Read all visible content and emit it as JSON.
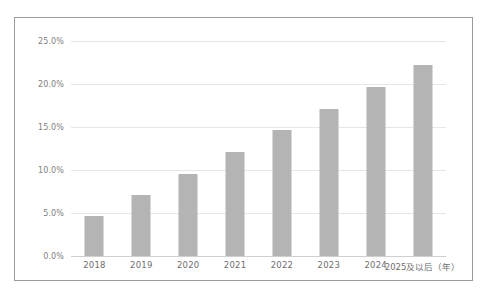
{
  "chart_data": {
    "type": "bar",
    "title": "",
    "subtitle": "",
    "xlabel": "年",
    "ylabel": "",
    "categories": [
      "2018",
      "2019",
      "2020",
      "2021",
      "2022",
      "2023",
      "2024",
      "2025及以后（年）"
    ],
    "values": [
      4.6,
      7.1,
      9.5,
      12.1,
      14.6,
      17.1,
      19.6,
      22.2
    ],
    "series": [
      {
        "name": "占比",
        "values": [
          4.6,
          7.1,
          9.5,
          12.1,
          14.6,
          17.1,
          19.6,
          22.2
        ]
      }
    ],
    "ylim": [
      0,
      25
    ],
    "yticks": [
      0,
      5,
      10,
      15,
      20,
      25
    ],
    "ytick_labels": [
      "0.0%",
      "5.0%",
      "10.0%",
      "15.0%",
      "20.0%",
      "25.0%"
    ],
    "grid": true,
    "legend": "none",
    "legend_position": "none",
    "bar_color": "#b4b4b4",
    "gridline_color": "#e6e6e6",
    "axis_color": "#cfcfcf",
    "frame_color": "#9a9a9a",
    "tick_label_color": "#808080",
    "annotations": []
  }
}
